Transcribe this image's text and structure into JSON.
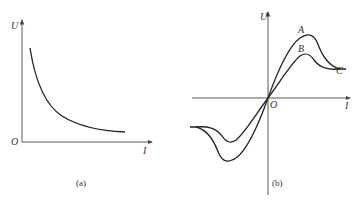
{
  "panel_a": {
    "caption": "(a)",
    "y_axis_label": "U",
    "x_axis_label": "I",
    "origin_label": "O",
    "description": "U decreases monotonically with I (hyperbolic-like decay)"
  },
  "panel_b": {
    "caption": "(b)",
    "y_axis_label": "U",
    "x_axis_label": "I",
    "origin_label": "O",
    "point_labels": [
      "A",
      "B",
      "C"
    ],
    "description": "Two odd-symmetric U-I curves through origin; upper curve peaks at A, lower at B, both converge toward C"
  }
}
